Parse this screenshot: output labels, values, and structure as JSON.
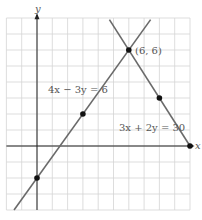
{
  "chart_data": {
    "type": "line",
    "title": "",
    "xlabel": "x",
    "ylabel": "y",
    "xlim": [
      -2,
      10
    ],
    "ylim": [
      -4,
      8
    ],
    "grid": true,
    "series": [
      {
        "name": "4x − 3y = 6",
        "equation": "4x - 3y = 6",
        "points": [
          [
            0,
            -2
          ],
          [
            3,
            2
          ],
          [
            6,
            6
          ]
        ]
      },
      {
        "name": "3x + 2y = 30",
        "equation": "3x + 2y = 30",
        "points": [
          [
            6,
            6
          ],
          [
            8,
            3
          ],
          [
            10,
            0
          ]
        ]
      }
    ],
    "annotations": [
      {
        "text": "(6, 6)",
        "x": 6,
        "y": 6
      }
    ]
  },
  "labels": {
    "x_axis": "x",
    "y_axis": "y",
    "line1": "4x − 3y = 6",
    "line2": "3x + 2y = 30",
    "intersection": "(6, 6)"
  },
  "colors": {
    "grid": "#d4d4d4",
    "axis": "#222222",
    "line": "#6a6a6a",
    "point": "#111111",
    "label": "#555555"
  }
}
